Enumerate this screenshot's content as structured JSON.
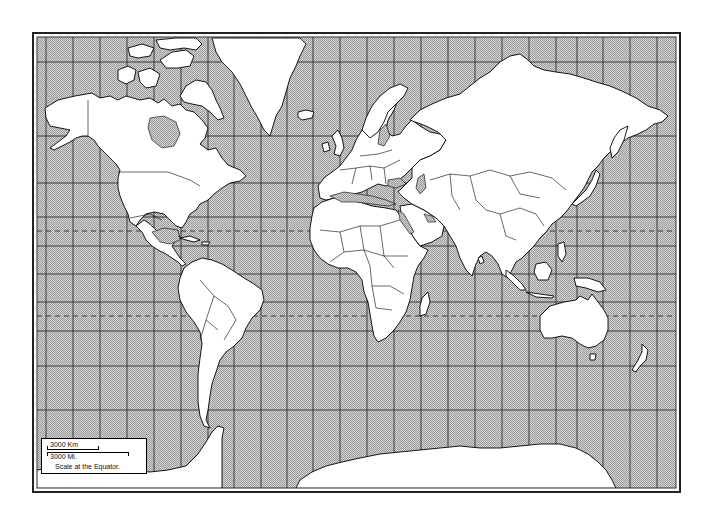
{
  "map": {
    "projection": "Mercator",
    "colors": {
      "ocean_dither_light": "#e6e6e6",
      "ocean_dither_dark": "#8c8c8c",
      "land": "#ffffff",
      "outline": "#000000",
      "grid": "#333333",
      "frame": "#222222"
    },
    "grid": {
      "meridians_x": [
        46,
        73,
        100,
        127,
        154,
        181,
        208,
        234,
        261,
        287,
        313,
        340,
        367,
        394,
        421,
        448,
        475,
        502,
        529,
        556,
        577,
        603,
        630,
        657
      ],
      "parallels_y": [
        62,
        136,
        183,
        217,
        246,
        274,
        302,
        331,
        366,
        410
      ],
      "tropics_dashed_y": [
        231,
        316
      ]
    }
  },
  "legend": {
    "scale_km_label": "3000 Km",
    "scale_mi_label": "3000 Mi.",
    "caption": "Scale at the Equator."
  }
}
